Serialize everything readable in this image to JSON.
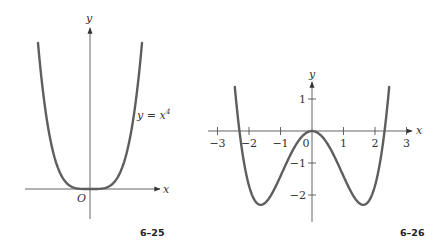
{
  "chart_data": [
    {
      "type": "line",
      "figure_label": "6–25",
      "title": "",
      "function_label": "y = x⁴",
      "function_label_base": "y = x",
      "function_label_exp": "4",
      "xlabel": "x",
      "ylabel": "y",
      "origin_label": "O",
      "grid": false,
      "x_ticks": [],
      "y_ticks": [],
      "series": [
        {
          "name": "y = x^4",
          "x": [
            -1.0,
            -0.75,
            -0.5,
            -0.25,
            0,
            0.25,
            0.5,
            0.75,
            1.0
          ],
          "y": [
            1.0,
            0.316,
            0.0625,
            0.0039,
            0,
            0.0039,
            0.0625,
            0.316,
            1.0
          ]
        }
      ]
    },
    {
      "type": "line",
      "figure_label": "6–26",
      "title": "",
      "xlabel": "x",
      "ylabel": "y",
      "grid": false,
      "xlim": [
        -3,
        3
      ],
      "ylim": [
        -2.5,
        1.5
      ],
      "x_ticks": [
        -3,
        -2,
        -1,
        0,
        1,
        2,
        3
      ],
      "x_tick_labels": [
        "−3",
        "−2",
        "−1",
        "0",
        "1",
        "2",
        "3"
      ],
      "y_ticks": [
        1,
        -1,
        -2
      ],
      "y_tick_labels": [
        "1",
        "−1",
        "−2"
      ],
      "series": [
        {
          "name": "quartic (double well)",
          "x": [
            -2.45,
            -2.3,
            -2.0,
            -1.6,
            -1.0,
            -0.5,
            0,
            0.5,
            1.0,
            1.6,
            2.0,
            2.3,
            2.45
          ],
          "y": [
            0.5,
            0.0,
            -1.7,
            -2.3,
            -1.4,
            -0.42,
            0,
            -0.42,
            -1.4,
            -2.3,
            -1.7,
            0.0,
            0.5
          ]
        }
      ]
    }
  ]
}
